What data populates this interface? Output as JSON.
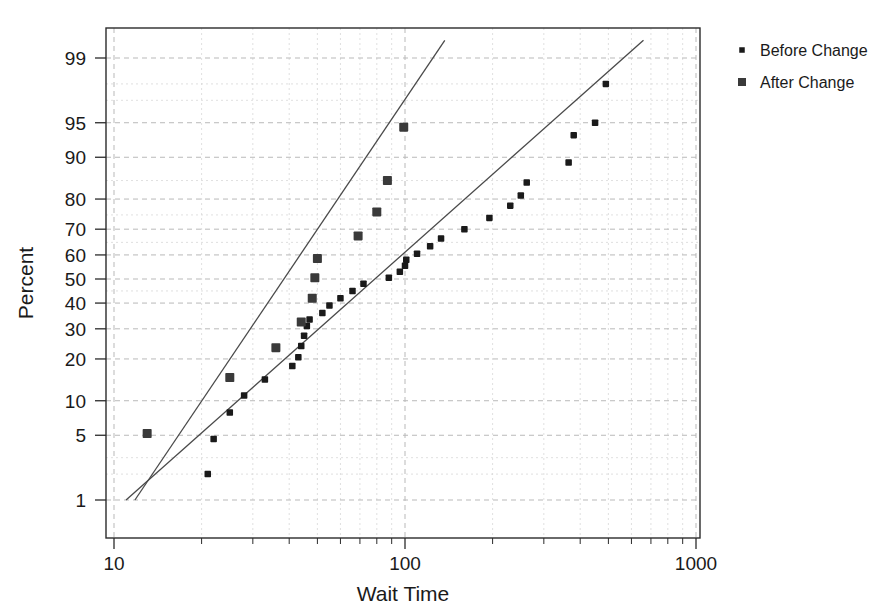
{
  "chart_data": {
    "type": "scatter",
    "title": "",
    "subtitle": "",
    "xlabel": "Wait Time",
    "ylabel": "Percent",
    "xscale": "log",
    "yscale": "normal-probability",
    "xlim": [
      10,
      1000
    ],
    "ylim": [
      0.6,
      99.7
    ],
    "grid": true,
    "legend_position": "right",
    "xticks": [
      10,
      100,
      1000
    ],
    "xtick_labels": [
      "10",
      "100",
      "1000"
    ],
    "yticks": [
      99,
      95,
      90,
      80,
      70,
      60,
      50,
      40,
      30,
      20,
      10,
      5,
      1
    ],
    "ytick_labels": [
      "99",
      "95",
      "90",
      "80",
      "70",
      "60",
      "50",
      "40",
      "30",
      "20",
      "10",
      "5",
      "1"
    ],
    "series": [
      {
        "name": "Before Change",
        "marker": "square-small",
        "color": "#1a1a1a",
        "points": [
          {
            "x": 21,
            "y": 2.0
          },
          {
            "x": 22,
            "y": 4.6
          },
          {
            "x": 25,
            "y": 8.0
          },
          {
            "x": 28,
            "y": 11.0
          },
          {
            "x": 33,
            "y": 14.5
          },
          {
            "x": 41,
            "y": 18.0
          },
          {
            "x": 43,
            "y": 20.5
          },
          {
            "x": 44,
            "y": 24.0
          },
          {
            "x": 45,
            "y": 27.5
          },
          {
            "x": 46,
            "y": 31.0
          },
          {
            "x": 47,
            "y": 33.5
          },
          {
            "x": 52,
            "y": 36.0
          },
          {
            "x": 55,
            "y": 39.0
          },
          {
            "x": 60,
            "y": 42.0
          },
          {
            "x": 66,
            "y": 45.0
          },
          {
            "x": 72,
            "y": 48.0
          },
          {
            "x": 88,
            "y": 50.5
          },
          {
            "x": 96,
            "y": 53.0
          },
          {
            "x": 100,
            "y": 55.5
          },
          {
            "x": 101,
            "y": 58.0
          },
          {
            "x": 110,
            "y": 60.5
          },
          {
            "x": 122,
            "y": 63.5
          },
          {
            "x": 133,
            "y": 66.5
          },
          {
            "x": 160,
            "y": 70.0
          },
          {
            "x": 195,
            "y": 74.0
          },
          {
            "x": 230,
            "y": 78.0
          },
          {
            "x": 250,
            "y": 81.0
          },
          {
            "x": 262,
            "y": 84.5
          },
          {
            "x": 365,
            "y": 89.0
          },
          {
            "x": 380,
            "y": 93.5
          },
          {
            "x": 450,
            "y": 95.0
          },
          {
            "x": 490,
            "y": 98.0
          }
        ]
      },
      {
        "name": "After Change",
        "marker": "square-large",
        "color": "#3a3a3a",
        "points": [
          {
            "x": 13,
            "y": 5.2
          },
          {
            "x": 25,
            "y": 15.0
          },
          {
            "x": 36,
            "y": 23.5
          },
          {
            "x": 44,
            "y": 32.5
          },
          {
            "x": 48,
            "y": 42.0
          },
          {
            "x": 49,
            "y": 50.5
          },
          {
            "x": 50,
            "y": 58.5
          },
          {
            "x": 69,
            "y": 67.5
          },
          {
            "x": 80,
            "y": 76.0
          },
          {
            "x": 87,
            "y": 85.0
          },
          {
            "x": 99,
            "y": 94.5
          }
        ]
      }
    ],
    "fit_lines": [
      {
        "name": "After Change fit",
        "x_start": 11.8,
        "y_start": 1.0,
        "x_end": 137,
        "y_end": 99.4
      },
      {
        "name": "Before Change fit",
        "x_start": 11.0,
        "y_start": 1.0,
        "x_end": 660,
        "y_end": 99.4
      }
    ]
  },
  "legend": {
    "entries": [
      {
        "label": "Before Change",
        "marker": "square-small"
      },
      {
        "label": "After Change",
        "marker": "square-large"
      }
    ]
  }
}
